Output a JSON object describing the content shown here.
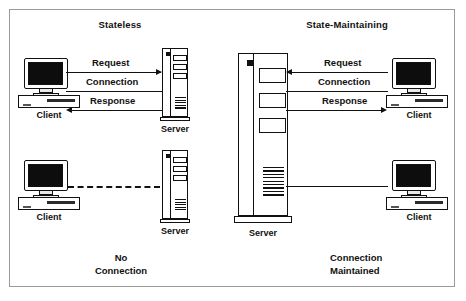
{
  "figure": {
    "panels": {
      "left": {
        "title": "Stateless",
        "caption_line1": "No",
        "caption_line2": "Connection",
        "top": {
          "client_label": "Client",
          "server_label": "Server",
          "flows": [
            {
              "label": "Request",
              "direction": "client-to-server",
              "style": "solid-arrow"
            },
            {
              "label": "Connection",
              "direction": "bidirectional",
              "style": "solid-plain"
            },
            {
              "label": "Response",
              "direction": "server-to-client",
              "style": "solid-arrow"
            }
          ]
        },
        "bottom": {
          "client_label": "Client",
          "server_label": "Server",
          "link_style": "dashed",
          "link_label": ""
        }
      },
      "right": {
        "title": "State-Maintaining",
        "caption_line1": "Connection",
        "caption_line2": "Maintained",
        "top": {
          "client_label": "Client",
          "server_label": "Server",
          "flows": [
            {
              "label": "Request",
              "direction": "client-to-server",
              "style": "solid-arrow"
            },
            {
              "label": "Connection",
              "direction": "bidirectional",
              "style": "solid-plain"
            },
            {
              "label": "Response",
              "direction": "server-to-client",
              "style": "solid-arrow"
            }
          ]
        },
        "bottom": {
          "client_label": "Client",
          "link_style": "solid"
        }
      }
    },
    "colors": {
      "stroke": "#111111",
      "frame": "#9a9a9a",
      "screen": "#0d0d0d",
      "background": "#ffffff"
    }
  }
}
